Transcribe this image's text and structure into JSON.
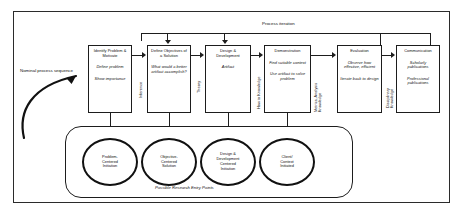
{
  "diagram": {
    "title_top": "Process iteration",
    "nominal_label": "Nominal process sequence",
    "entry_caption": "Possible Research Entry Points"
  },
  "steps": [
    {
      "id": "identify-problem",
      "title": "Identify Problem & Motivate",
      "sub1": "Define problem",
      "sub2": "Show importance"
    },
    {
      "id": "define-objectives",
      "title": "Define Objectives of a Solution",
      "sub1": "What would a better artifact accomplish?",
      "sub2": ""
    },
    {
      "id": "design-development",
      "title": "Design & Development",
      "sub1": "Artifact",
      "sub2": ""
    },
    {
      "id": "demonstration",
      "title": "Demonstration",
      "sub1": "Find suitable context",
      "sub2": "Use artifact to solve problem"
    },
    {
      "id": "evaluation",
      "title": "Evaluation",
      "sub1": "Observe how effective, efficient",
      "sub2": "Iterate back to design"
    },
    {
      "id": "communication",
      "title": "Communication",
      "sub1": "Scholarly publications",
      "sub2": "Professional publications"
    }
  ],
  "connector_labels": [
    {
      "id": "inference",
      "text": "Inference"
    },
    {
      "id": "theory",
      "text": "Theory"
    },
    {
      "id": "how-to-knowledge",
      "text": "How to Knowledge"
    },
    {
      "id": "metrics-analysis-knowledge",
      "line1": "Metrics, Analysis",
      "line2": "Knowledge"
    },
    {
      "id": "disciplinary-knowledge",
      "line1": "Disciplinary",
      "line2": "Knowledge"
    }
  ],
  "entry_points": [
    {
      "id": "problem-centered",
      "line1": "Problem-",
      "line2": "Centered",
      "line3": "Initiation"
    },
    {
      "id": "objective-centered",
      "line1": "Objective-",
      "line2": "Centered",
      "line3": "Solution"
    },
    {
      "id": "design-development-centered",
      "line1": "Design &",
      "line2": "Development",
      "line3": "Centered",
      "line4": "Initiation"
    },
    {
      "id": "client-context",
      "line1": "Client/",
      "line2": "Context",
      "line3": "Initiated"
    }
  ],
  "colors": {
    "stroke": "#1d1d1d",
    "background": "#ffffff",
    "text": "#111111"
  }
}
